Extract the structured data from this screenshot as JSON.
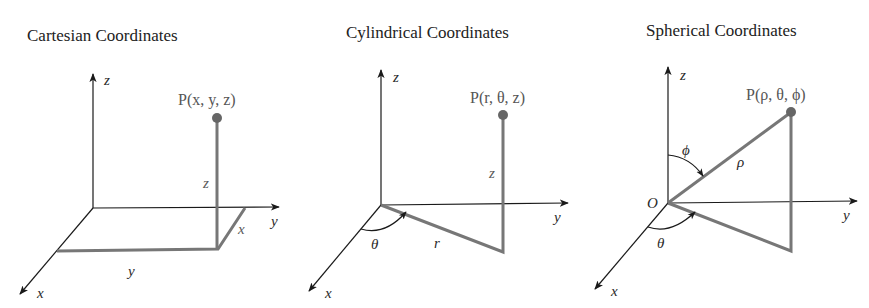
{
  "panels": [
    {
      "title": "Cartesian Coordinates",
      "point_label": "P(x, y, z)",
      "axis_labels": {
        "x": "x",
        "y": "y",
        "z": "z"
      },
      "segment_labels": {
        "height": "z",
        "depth": "x",
        "width": "y"
      }
    },
    {
      "title": "Cylindrical Coordinates",
      "point_label": "P(r, θ, z)",
      "axis_labels": {
        "x": "x",
        "y": "y",
        "z": "z"
      },
      "segment_labels": {
        "height": "z",
        "radius": "r",
        "angle": "θ"
      }
    },
    {
      "title": "Spherical Coordinates",
      "point_label": "P(ρ, θ, ϕ)",
      "axis_labels": {
        "x": "x",
        "y": "y",
        "z": "z"
      },
      "origin_label": "O",
      "segment_labels": {
        "rho": "ρ",
        "phi": "ϕ",
        "theta": "θ"
      }
    }
  ],
  "colors": {
    "axis": "#1a1a1a",
    "construction": "#777777",
    "point": "#666666",
    "point_label": "#555555"
  }
}
